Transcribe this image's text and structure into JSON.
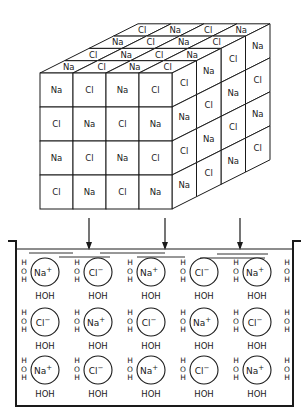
{
  "diagram": {
    "crystal": {
      "front_face": [
        [
          "Na",
          "Cl",
          "Na",
          "Cl"
        ],
        [
          "Cl",
          "Na",
          "Cl",
          "Na"
        ],
        [
          "Na",
          "Cl",
          "Na",
          "Cl"
        ],
        [
          "Cl",
          "Na",
          "Cl",
          "Na"
        ]
      ],
      "top_face": [
        [
          "Na",
          "Cl",
          "Na",
          "Cl"
        ],
        [
          "Cl",
          "Na",
          "Cl",
          "Na"
        ],
        [
          "Na",
          "Cl",
          "Na",
          "Cl"
        ],
        [
          "Cl",
          "Na",
          "Cl",
          "Na"
        ]
      ],
      "side_face": [
        [
          "Cl",
          "Na",
          "Cl",
          "Na"
        ],
        [
          "Na",
          "Cl",
          "Na",
          "Cl"
        ],
        [
          "Cl",
          "Na",
          "Cl",
          "Na"
        ],
        [
          "Na",
          "Cl",
          "Na",
          "Cl"
        ]
      ]
    },
    "arrows": 3,
    "solution": {
      "rows": [
        [
          "Na+",
          "Cl−",
          "Na+",
          "Cl−",
          "Na+"
        ],
        [
          "Cl−",
          "Na+",
          "Cl−",
          "Na+",
          "Cl−"
        ],
        [
          "Na+",
          "Cl−",
          "Na+",
          "Cl−",
          "Na+"
        ]
      ],
      "water_label": "HOH",
      "water_vertical": [
        "H",
        "O",
        "H"
      ]
    },
    "colors": {
      "line": "#1a1a1a",
      "background": "#ffffff"
    }
  }
}
